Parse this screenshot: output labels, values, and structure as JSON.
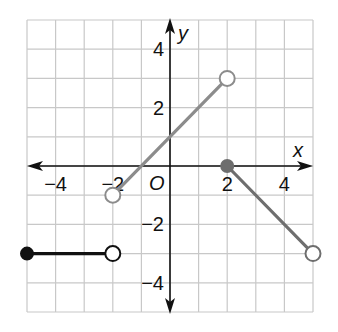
{
  "chart_data": {
    "type": "line",
    "title": "",
    "xlabel": "x",
    "ylabel": "y",
    "origin_label": "O",
    "xlim": [
      -5,
      5
    ],
    "ylim": [
      -5,
      5
    ],
    "grid": true,
    "x_ticks": [
      -4,
      -2,
      2,
      4
    ],
    "y_ticks": [
      4,
      2,
      -2,
      -4
    ],
    "x_tick_labels": [
      "−4",
      "−2",
      "2",
      "4"
    ],
    "y_tick_labels": [
      "4",
      "2",
      "−2",
      "−4"
    ],
    "series": [
      {
        "name": "segment-1",
        "color": "#111111",
        "points": [
          [
            -5,
            -3
          ],
          [
            -2,
            -3
          ]
        ],
        "start": "closed",
        "end": "open"
      },
      {
        "name": "segment-2",
        "color": "#8c8c8c",
        "points": [
          [
            -2,
            -1
          ],
          [
            2,
            3
          ]
        ],
        "start": "open",
        "end": "open"
      },
      {
        "name": "segment-3",
        "color": "#6e6e6e",
        "points": [
          [
            2,
            0
          ],
          [
            5,
            -3
          ]
        ],
        "start": "closed",
        "end": "open"
      }
    ]
  }
}
